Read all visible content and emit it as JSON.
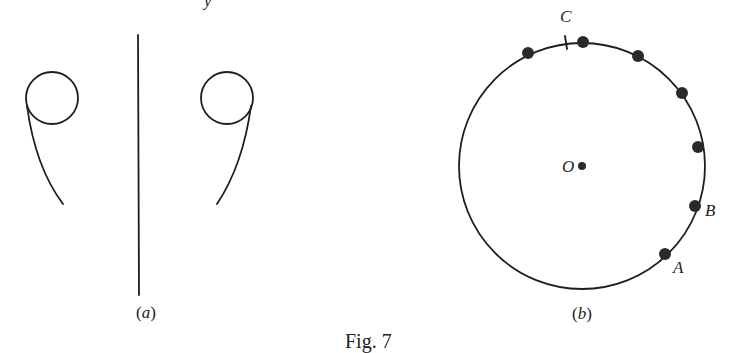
{
  "top_fragment": {
    "text": "y"
  },
  "caption": {
    "text": "Fig. 7"
  },
  "panel_a": {
    "label_open": "(",
    "label_letter": "a",
    "label_close": ")",
    "left_loop": {
      "circle": {
        "cx": 52,
        "cy": 98,
        "r": 26
      },
      "tail": "M27,106 C33,150 45,180 63,204"
    },
    "right_loop": {
      "circle": {
        "cx": 227,
        "cy": 98,
        "r": 26
      },
      "tail": "M251,106 C245,150 233,180 217,204"
    },
    "divider": {
      "x1": 138,
      "y1": 35,
      "x2": 139,
      "y2": 295
    }
  },
  "panel_b": {
    "label_open": "(",
    "label_letter": "b",
    "label_close": ")",
    "circle": {
      "cx": 582,
      "cy": 166,
      "r": 123
    },
    "center_label": "O",
    "center_dot": {
      "x": 582,
      "y": 166,
      "r": 4
    },
    "points": [
      {
        "x": 528,
        "y": 53
      },
      {
        "x": 583,
        "y": 42
      },
      {
        "x": 638,
        "y": 56
      },
      {
        "x": 682,
        "y": 93
      },
      {
        "x": 698,
        "y": 147
      },
      {
        "x": 695,
        "y": 206
      },
      {
        "x": 665,
        "y": 254
      }
    ],
    "point_labels": {
      "A": "A",
      "B": "B",
      "C": "C"
    },
    "tick_C": {
      "x": 566,
      "y": 43
    }
  }
}
